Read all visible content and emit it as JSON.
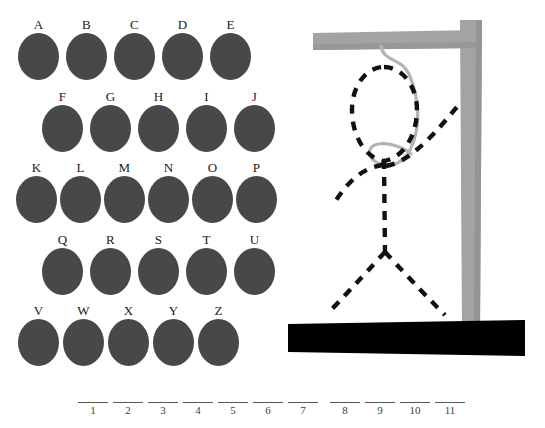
{
  "game": {
    "title": "Hangman",
    "colors": {
      "letter_disc": "#484848",
      "letter_label": "#1a1a1a",
      "gallows_wood": "#a0a0a0",
      "gallows_wood_shade": "#8e8e8e",
      "ground": "#000000",
      "rope": "#b0b0b0",
      "figure_stroke": "#111111",
      "blank_rule": "#555555",
      "background": "#ffffff"
    }
  },
  "letter_board": {
    "name": "alphabet-keyboard",
    "rows": [
      {
        "offset_x": 18,
        "offset_y": 18,
        "pitch": 48,
        "keys": [
          {
            "letter": "A",
            "used": false
          },
          {
            "letter": "B",
            "used": false
          },
          {
            "letter": "C",
            "used": false
          },
          {
            "letter": "D",
            "used": false
          },
          {
            "letter": "E",
            "used": false
          }
        ]
      },
      {
        "offset_x": 42,
        "offset_y": 90,
        "pitch": 48,
        "keys": [
          {
            "letter": "F",
            "used": false
          },
          {
            "letter": "G",
            "used": false
          },
          {
            "letter": "H",
            "used": false
          },
          {
            "letter": "I",
            "used": false
          },
          {
            "letter": "J",
            "used": false
          }
        ]
      },
      {
        "offset_x": 16,
        "offset_y": 161,
        "pitch": 44,
        "keys": [
          {
            "letter": "K",
            "used": false
          },
          {
            "letter": "L",
            "used": false
          },
          {
            "letter": "M",
            "used": false
          },
          {
            "letter": "N",
            "used": false
          },
          {
            "letter": "O",
            "used": false
          },
          {
            "letter": "P",
            "used": false
          }
        ]
      },
      {
        "offset_x": 42,
        "offset_y": 233,
        "pitch": 48,
        "keys": [
          {
            "letter": "Q",
            "used": false
          },
          {
            "letter": "R",
            "used": false
          },
          {
            "letter": "S",
            "used": false
          },
          {
            "letter": "T",
            "used": false
          },
          {
            "letter": "U",
            "used": false
          }
        ]
      },
      {
        "offset_x": 18,
        "offset_y": 304,
        "pitch": 45,
        "keys": [
          {
            "letter": "V",
            "used": false
          },
          {
            "letter": "W",
            "used": false
          },
          {
            "letter": "X",
            "used": false
          },
          {
            "letter": "Y",
            "used": false
          },
          {
            "letter": "Z",
            "used": false
          }
        ]
      }
    ]
  },
  "gallows": {
    "name": "gallows-scene",
    "parts_drawn": [
      "beam",
      "post",
      "ground",
      "rope",
      "head",
      "body",
      "left-arm",
      "right-arm",
      "left-leg",
      "right-leg"
    ],
    "figure_style": "dashed-outline"
  },
  "word_blanks": {
    "name": "word-blanks",
    "groups": [
      {
        "slots": [
          {
            "number": "1",
            "letter": ""
          },
          {
            "number": "2",
            "letter": ""
          },
          {
            "number": "3",
            "letter": ""
          },
          {
            "number": "4",
            "letter": ""
          },
          {
            "number": "5",
            "letter": ""
          },
          {
            "number": "6",
            "letter": ""
          },
          {
            "number": "7",
            "letter": ""
          }
        ]
      },
      {
        "slots": [
          {
            "number": "8",
            "letter": ""
          },
          {
            "number": "9",
            "letter": ""
          },
          {
            "number": "10",
            "letter": ""
          },
          {
            "number": "11",
            "letter": ""
          }
        ]
      }
    ]
  }
}
